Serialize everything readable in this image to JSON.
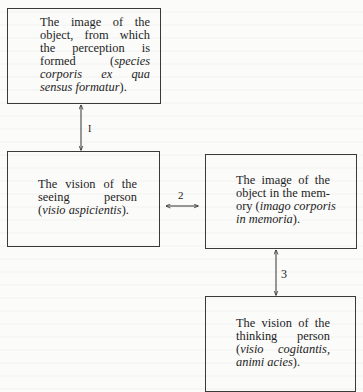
{
  "diagram": {
    "nodes": [
      {
        "id": "object-image",
        "lines": [
          [
            {
              "t": "The image of the",
              "i": false
            }
          ],
          [
            {
              "t": "object, from which",
              "i": false
            }
          ],
          [
            {
              "t": "the perception is",
              "i": false
            }
          ],
          [
            {
              "t": "formed (",
              "i": false
            },
            {
              "t": "species",
              "i": true
            }
          ],
          [
            {
              "t": "corporis ex qua",
              "i": true
            }
          ],
          [
            {
              "t": "sensus formatur",
              "i": true
            },
            {
              "t": ").",
              "i": false
            }
          ]
        ],
        "text": "The image of the object, from which the perception is formed (species corporis ex qua sensus formatur)."
      },
      {
        "id": "seeing-vision",
        "lines": [
          [
            {
              "t": "The vision of the",
              "i": false
            }
          ],
          [
            {
              "t": "seeing person",
              "i": false
            }
          ],
          [
            {
              "t": "(",
              "i": false
            },
            {
              "t": "visio aspicientis",
              "i": true
            },
            {
              "t": ").",
              "i": false
            }
          ]
        ],
        "text": "The vision of the seeing person (visio aspicientis)."
      },
      {
        "id": "memory-image",
        "lines": [
          [
            {
              "t": "The image of the",
              "i": false
            }
          ],
          [
            {
              "t": "object in the mem-",
              "i": false
            }
          ],
          [
            {
              "t": "ory (",
              "i": false
            },
            {
              "t": "imago corporis",
              "i": true
            }
          ],
          [
            {
              "t": "in memoria",
              "i": true
            },
            {
              "t": ").",
              "i": false
            }
          ]
        ],
        "text": "The image of the object in the memory (imago corporis in memoria)."
      },
      {
        "id": "thinking-vision",
        "lines": [
          [
            {
              "t": "The vision of the",
              "i": false
            }
          ],
          [
            {
              "t": "thinking person",
              "i": false
            }
          ],
          [
            {
              "t": "(",
              "i": false
            },
            {
              "t": "visio cogitantis,",
              "i": true
            }
          ],
          [
            {
              "t": "animi acies",
              "i": true
            },
            {
              "t": ").",
              "i": false
            }
          ]
        ],
        "text": "The vision of the thinking person (visio cogitantis, animi acies)."
      }
    ],
    "edges": [
      {
        "label": "I",
        "from": "object-image",
        "to": "seeing-vision",
        "direction": "bidirectional"
      },
      {
        "label": "2",
        "from": "seeing-vision",
        "to": "memory-image",
        "direction": "bidirectional"
      },
      {
        "label": "3",
        "from": "memory-image",
        "to": "thinking-vision",
        "direction": "bidirectional"
      }
    ]
  }
}
